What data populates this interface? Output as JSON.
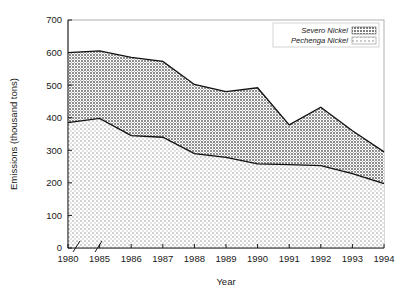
{
  "chart_data": {
    "type": "area",
    "stacked": true,
    "title": "",
    "xlabel": "Year",
    "ylabel": "Emissions (thousand tons)",
    "categories": [
      "1980",
      "1985",
      "1986",
      "1987",
      "1988",
      "1989",
      "1990",
      "1991",
      "1992",
      "1993",
      "1994"
    ],
    "x_axis_break_after": "1980",
    "ylim": [
      0,
      700
    ],
    "y_ticks": [
      0,
      100,
      200,
      300,
      400,
      500,
      600,
      700
    ],
    "y_tick_labels": [
      "0",
      "100",
      "200",
      "300",
      "400",
      "500",
      "600",
      "700"
    ],
    "grid": false,
    "legend_position": "top-right",
    "series": [
      {
        "name": "Severo Nickel",
        "pattern": "dense-dot-hatch",
        "color": "#9a9a9a",
        "values": [
          215,
          207,
          240,
          233,
          212,
          202,
          234,
          122,
          179,
          132,
          97
        ]
      },
      {
        "name": "Pechenga Nickel",
        "pattern": "light-checker-hatch",
        "color": "#d9d9d9",
        "values": [
          385,
          398,
          345,
          340,
          290,
          278,
          258,
          256,
          253,
          228,
          198
        ]
      }
    ],
    "cumulative_totals": [
      600,
      605,
      585,
      573,
      502,
      480,
      492,
      378,
      432,
      360,
      295
    ],
    "annotations": []
  },
  "legend": {
    "items": [
      {
        "label": "Severo Nickel"
      },
      {
        "label": "Pechenga Nickel"
      }
    ]
  },
  "colors": {
    "axis": "#1a1a1a",
    "frame": "#b0b0b0",
    "severo_fill": "#9a9a9a",
    "pechenga_fill": "#dcdcdc",
    "background": "#ffffff"
  }
}
